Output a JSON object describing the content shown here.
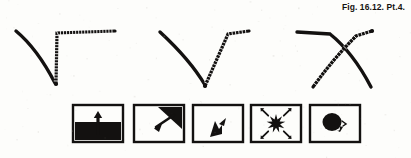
{
  "plate": {
    "caption": "Fig. 16.12. Pt.4.",
    "ink_color": "#131110",
    "background_color": "#fdfdfb"
  },
  "curve_diagrams": [
    {
      "name": "curve-diagram-1",
      "shape_label": "angular-corner-with-curve",
      "smooth_curve": "M16,31 C28,41 42,58 55,83",
      "ticked_path": "M56,84 L57,33 L115,31",
      "tick_count_vertical": 17,
      "tick_count_horizontal": 19
    },
    {
      "name": "curve-diagram-2",
      "shape_label": "v-shape-with-curve",
      "smooth_curve": "M160,32 C173,44 192,63 205,85",
      "ticked_path": "M205,86 L228,34 L249,31",
      "tick_count_vertical": 15,
      "tick_count_horizontal": 8
    },
    {
      "name": "curve-diagram-3",
      "shape_label": "crossed-y-shape",
      "smooth_curve": "M297,32 L330,34 C345,46 360,66 371,87",
      "ticked_path": "M372,31 L356,36 C344,48 328,66 313,87",
      "tick_count_vertical": 14,
      "tick_count_horizontal": 9
    }
  ],
  "icon_panels": [
    {
      "name": "panel-upward-arrow-over-ground",
      "index": 1,
      "description": "dark filled lower half with upward arrow",
      "x": 73
    },
    {
      "name": "panel-corner-wedge-arrow",
      "index": 2,
      "description": "dark wedge in upper right corner with arrow pointing down-left",
      "x": 134
    },
    {
      "name": "panel-small-spike-arrow",
      "index": 3,
      "description": "small dark spike with arrowhead pointing up-right",
      "x": 193
    },
    {
      "name": "panel-starburst-radiating-arrows",
      "index": 4,
      "description": "starburst with four arrows radiating outward",
      "x": 251
    },
    {
      "name": "panel-blob-with-tail",
      "index": 5,
      "description": "dark circular blob with small curved tail at lower right",
      "x": 310
    }
  ]
}
